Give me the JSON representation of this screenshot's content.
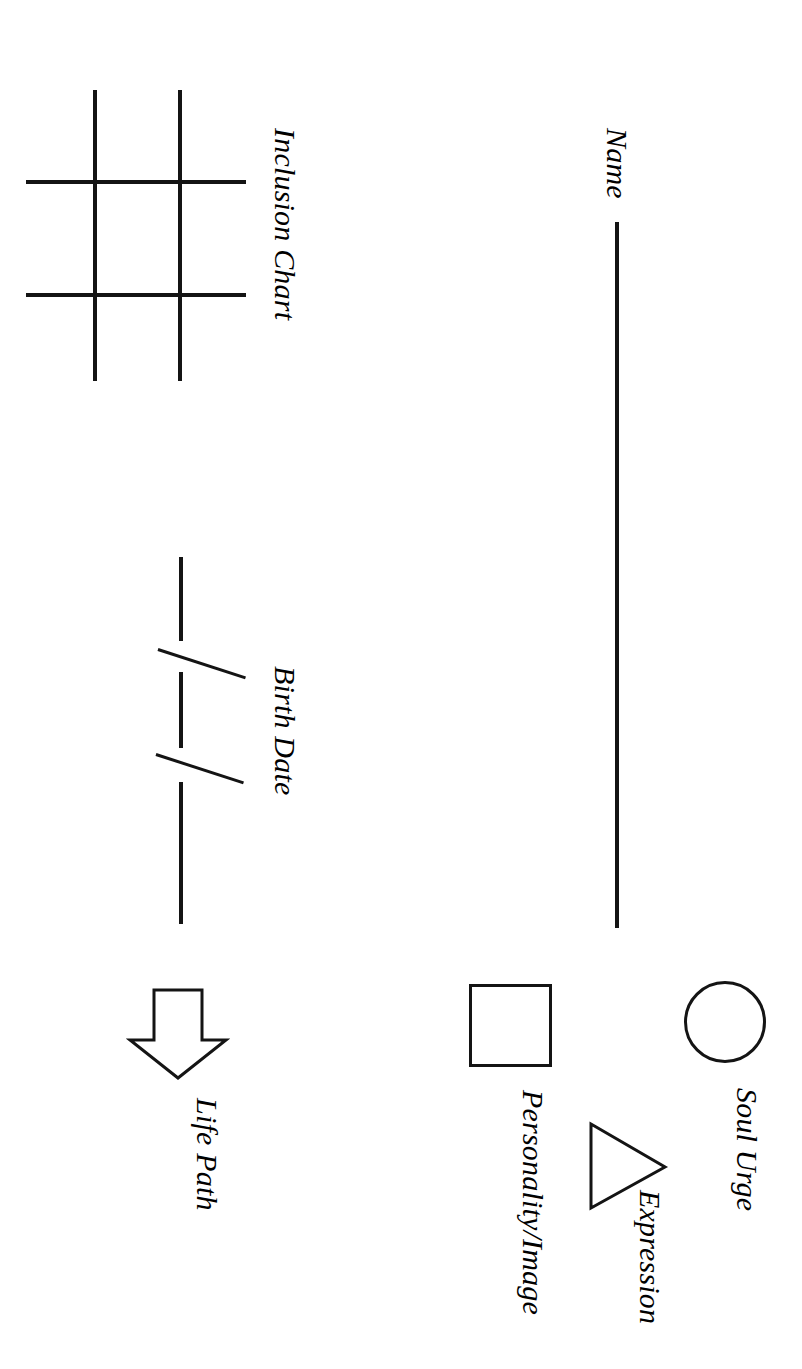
{
  "document": {
    "type": "numerology-worksheet",
    "orientation": "landscape-scanned-sideways",
    "background_color": "#ffffff",
    "ink_color": "#141414"
  },
  "sections": {
    "name": {
      "label": "Name",
      "blank_line": true
    },
    "inclusion_chart": {
      "label": "Inclusion Chart",
      "grid": {
        "rows": 3,
        "columns": 3,
        "vertical_lines": 2,
        "horizontal_lines": 2
      }
    },
    "birth_date": {
      "label": "Birth Date",
      "blanks": 3,
      "separators": 2,
      "separator_glyph": "/"
    },
    "life_path": {
      "label": "Life Path",
      "icon": "down-arrow-icon"
    },
    "soul_urge": {
      "label": "Soul Urge",
      "icon": "circle-icon"
    },
    "expression": {
      "label": "Expression",
      "icon": "triangle-icon"
    },
    "personality_image": {
      "label": "Personality/Image",
      "icon": "square-icon"
    }
  }
}
